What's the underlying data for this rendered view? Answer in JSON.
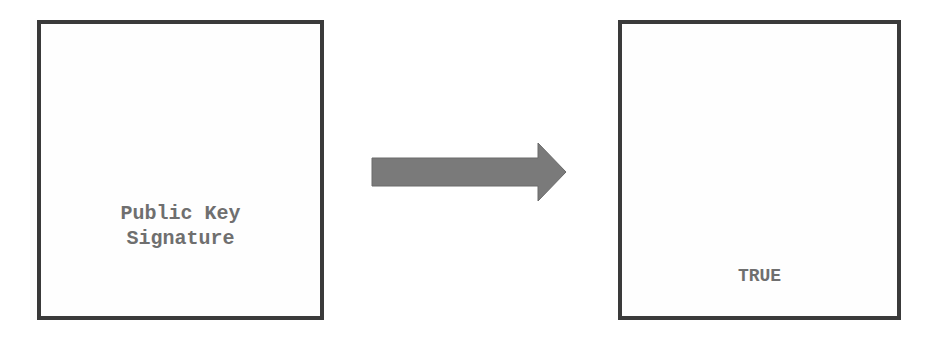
{
  "diagram": {
    "input_box": {
      "label": "Public Key\nSignature"
    },
    "output_box": {
      "label": "TRUE"
    },
    "arrow": {
      "direction": "right",
      "color": "#7a7a7a"
    },
    "colors": {
      "border": "#3a3a3a",
      "text": "#6f6f6f",
      "background": "#ffffff"
    }
  }
}
